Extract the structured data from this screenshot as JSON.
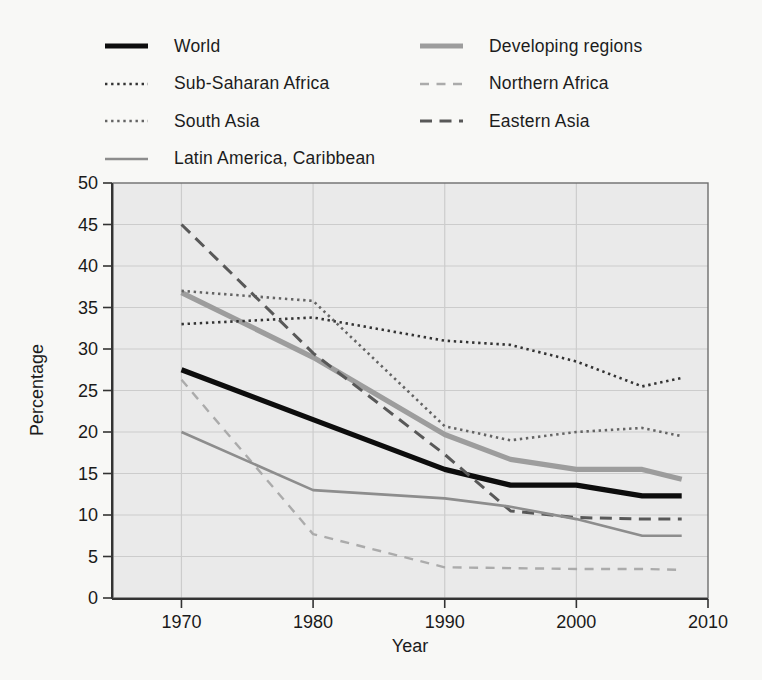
{
  "figure": {
    "kind": "scanned-book-line-chart",
    "background": "#f8f8f6",
    "plot_background": "#eaeaea",
    "gridline_color": "#cccccc",
    "border_color": "#6e6e6e",
    "axis_color": "#333333"
  },
  "chart_data": {
    "type": "line",
    "title": "",
    "xlabel": "Year",
    "ylabel": "Percentage",
    "xlim": [
      1964.8,
      2010
    ],
    "ylim": [
      0,
      50
    ],
    "xticks": [
      1970,
      1980,
      1990,
      2000,
      2010
    ],
    "yticks": [
      0,
      5,
      10,
      15,
      20,
      25,
      30,
      35,
      40,
      45,
      50
    ],
    "grid": true,
    "legend_position": "top",
    "x": [
      1970,
      1980,
      1990,
      1995,
      2000,
      2005,
      2008
    ],
    "series": [
      {
        "id": "world",
        "name": "World",
        "values": [
          27.5,
          21.5,
          15.5,
          13.6,
          13.6,
          12.3,
          12.3
        ],
        "color": "#0d0d0d",
        "style": "solid",
        "width": 5.2
      },
      {
        "id": "developing-regions",
        "name": "Developing regions",
        "values": [
          36.8,
          29.0,
          19.7,
          16.7,
          15.5,
          15.5,
          14.3
        ],
        "color": "#9d9d9d",
        "style": "solid",
        "width": 5.2
      },
      {
        "id": "sub-saharan-africa",
        "name": "Sub-Saharan Africa",
        "values": [
          33.0,
          33.8,
          31.0,
          30.5,
          28.5,
          25.5,
          26.5
        ],
        "color": "#333333",
        "style": "dotted",
        "width": 2.6
      },
      {
        "id": "northern-africa",
        "name": "Northern Africa",
        "values": [
          26.3,
          7.7,
          3.7,
          3.6,
          3.5,
          3.5,
          3.4
        ],
        "color": "#ababab",
        "style": "dash-short",
        "width": 2.4
      },
      {
        "id": "south-asia",
        "name": "South Asia",
        "values": [
          37.0,
          35.8,
          20.7,
          19.0,
          20.0,
          20.5,
          19.5
        ],
        "color": "#646464",
        "style": "dotted",
        "width": 2.6
      },
      {
        "id": "eastern-asia",
        "name": "Eastern Asia",
        "values": [
          45.0,
          29.5,
          17.3,
          10.5,
          9.7,
          9.5,
          9.5
        ],
        "color": "#585858",
        "style": "dash-long",
        "width": 3.0
      },
      {
        "id": "latin-america-caribbean",
        "name": "Latin America, Caribbean",
        "values": [
          20.0,
          13.0,
          12.0,
          11.0,
          9.5,
          7.5,
          7.5
        ],
        "color": "#8d8d8d",
        "style": "solid",
        "width": 2.6
      }
    ],
    "legend": {
      "columns": [
        [
          "world",
          "sub-saharan-africa",
          "south-asia",
          "latin-america-caribbean"
        ],
        [
          "developing-regions",
          "northern-africa",
          "eastern-asia"
        ]
      ]
    }
  }
}
